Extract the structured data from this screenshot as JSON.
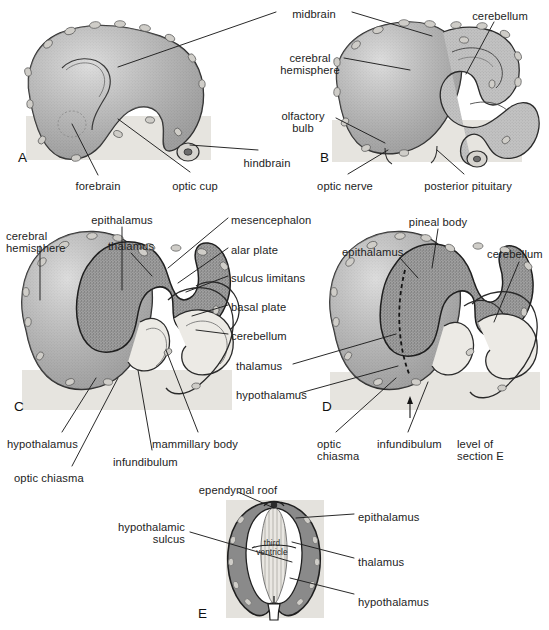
{
  "figure": {
    "background_color": "#ffffff",
    "ink_color": "#1d1d1d",
    "tissue_fill": "#b9b9b9",
    "tissue_dark_fill": "#8f8f8f",
    "ventricle_fill": "#f4f2ee",
    "wall_fill": "#8a8a8a",
    "panel_shadow": "#e3e1dc"
  },
  "panels": [
    {
      "id": "A",
      "letter": "A",
      "letter_x": 18,
      "letter_y": 150
    },
    {
      "id": "B",
      "letter": "B",
      "letter_x": 320,
      "letter_y": 150
    },
    {
      "id": "C",
      "letter": "C",
      "letter_x": 14,
      "letter_y": 399
    },
    {
      "id": "D",
      "letter": "D",
      "letter_x": 322,
      "letter_y": 399
    },
    {
      "id": "E",
      "letter": "E",
      "letter_x": 198,
      "letter_y": 606
    }
  ],
  "labels": [
    {
      "id": "midbrain",
      "text": "midbrain",
      "x": 314,
      "y": 8,
      "align": "ctr"
    },
    {
      "id": "cerebellum_b",
      "text": "cerebellum",
      "x": 500,
      "y": 10,
      "align": "ctr"
    },
    {
      "id": "cerebral_hemisphere_b",
      "text": "cerebral\nhemisphere",
      "x": 310,
      "y": 52,
      "align": "ctr"
    },
    {
      "id": "olfactory_bulb",
      "text": "olfactory\nbulb",
      "x": 303,
      "y": 110,
      "align": "ctr"
    },
    {
      "id": "hindbrain",
      "text": "hindbrain",
      "x": 267,
      "y": 157,
      "align": "ctr"
    },
    {
      "id": "forebrain",
      "text": "forebrain",
      "x": 98,
      "y": 180,
      "align": "ctr"
    },
    {
      "id": "optic_cup",
      "text": "optic cup",
      "x": 195,
      "y": 180,
      "align": "ctr"
    },
    {
      "id": "optic_nerve",
      "text": "optic nerve",
      "x": 345,
      "y": 180,
      "align": "ctr"
    },
    {
      "id": "posterior_pituitary",
      "text": "posterior pituitary",
      "x": 468,
      "y": 180,
      "align": "ctr"
    },
    {
      "id": "epithalamus_c",
      "text": "epithalamus",
      "x": 122,
      "y": 214,
      "align": "ctr"
    },
    {
      "id": "mesencephalon",
      "text": "mesencephalon",
      "x": 231,
      "y": 214,
      "align": "left"
    },
    {
      "id": "pineal_body",
      "text": "pineal body",
      "x": 438,
      "y": 216,
      "align": "ctr"
    },
    {
      "id": "cerebral_hemisphere_c",
      "text": "cerebral\nhemisphere",
      "x": 6,
      "y": 230,
      "align": "left"
    },
    {
      "id": "thalamus_c_top",
      "text": "thalamus",
      "x": 131,
      "y": 240,
      "align": "ctr"
    },
    {
      "id": "alar_plate",
      "text": "alar plate",
      "x": 231,
      "y": 244,
      "align": "left"
    },
    {
      "id": "epithalamus_d",
      "text": "epithalamus",
      "x": 342,
      "y": 246,
      "align": "left"
    },
    {
      "id": "cerebellum_d",
      "text": "cerebellum",
      "x": 487,
      "y": 248,
      "align": "left"
    },
    {
      "id": "sulcus_limitans",
      "text": "sulcus limitans",
      "x": 231,
      "y": 272,
      "align": "left"
    },
    {
      "id": "basal_plate",
      "text": "basal plate",
      "x": 231,
      "y": 301,
      "align": "left"
    },
    {
      "id": "cerebellum_c",
      "text": "cerebellum",
      "x": 231,
      "y": 330,
      "align": "left"
    },
    {
      "id": "thalamus_d",
      "text": "thalamus",
      "x": 236,
      "y": 360,
      "align": "left"
    },
    {
      "id": "hypothalamus_d",
      "text": "hypothalamus",
      "x": 236,
      "y": 389,
      "align": "left"
    },
    {
      "id": "hypothalamus_c",
      "text": "hypothalamus",
      "x": 7,
      "y": 438,
      "align": "left"
    },
    {
      "id": "mammillary_body",
      "text": "mammillary body",
      "x": 152,
      "y": 438,
      "align": "left"
    },
    {
      "id": "infundibulum_c",
      "text": "infundibulum",
      "x": 113,
      "y": 456,
      "align": "left"
    },
    {
      "id": "infundibulum_d",
      "text": "infundibulum",
      "x": 377,
      "y": 438,
      "align": "left"
    },
    {
      "id": "level_of_section_e",
      "text": "level of\nsection E",
      "x": 457,
      "y": 438,
      "align": "left"
    },
    {
      "id": "optic_chiasma_c",
      "text": "optic chiasma",
      "x": 14,
      "y": 472,
      "align": "left"
    },
    {
      "id": "optic_chiasma_d",
      "text": "optic\nchiasma",
      "x": 317,
      "y": 438,
      "align": "left"
    },
    {
      "id": "ependymal_roof",
      "text": "ependymal roof",
      "x": 238,
      "y": 484,
      "align": "ctr"
    },
    {
      "id": "epithalamus_e",
      "text": "epithalamus",
      "x": 358,
      "y": 511,
      "align": "left"
    },
    {
      "id": "hypothalamic_sulcus",
      "text": "hypothalamic\nsulcus",
      "x": 185,
      "y": 527,
      "align": "rt"
    },
    {
      "id": "thalamus_e",
      "text": "thalamus",
      "x": 358,
      "y": 556,
      "align": "left"
    },
    {
      "id": "hypothalamus_e",
      "text": "hypothalamus",
      "x": 358,
      "y": 596,
      "align": "left"
    },
    {
      "id": "third_ventricle",
      "text": "third\nventricle",
      "x": 272,
      "y": 545,
      "align": "ctr"
    }
  ]
}
